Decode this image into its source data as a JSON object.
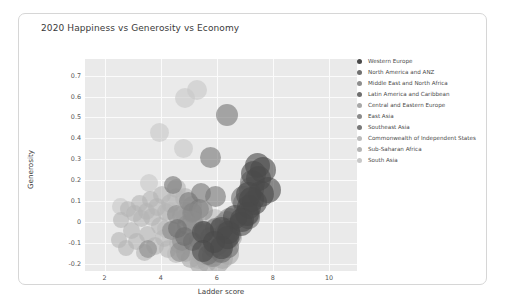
{
  "card": {
    "title": "2020 Happiness vs Generosity vs Economy"
  },
  "axes": {
    "x_title": "Ladder score",
    "y_title": "Generosity",
    "x_ticks": [
      "2",
      "4",
      "6",
      "8",
      "10"
    ],
    "y_ticks": [
      "0.7",
      "0.6",
      "0.5",
      "0.4",
      "0.3",
      "0.2",
      "0.1",
      "0",
      "-0.1",
      "-0.2"
    ]
  },
  "legend": {
    "items": [
      {
        "label": "Western Europe",
        "color": "#4a4a4a"
      },
      {
        "label": "North America and ANZ",
        "color": "#707070"
      },
      {
        "label": "Middle East and North Africa",
        "color": "#8d8d8d"
      },
      {
        "label": "Latin America and Caribbean",
        "color": "#6e6e6e"
      },
      {
        "label": "Central and Eastern Europe",
        "color": "#a8a8a8"
      },
      {
        "label": "East Asia",
        "color": "#8a8a8a"
      },
      {
        "label": "Southeast Asia",
        "color": "#787878"
      },
      {
        "label": "Commonwealth of Independent States",
        "color": "#bcbcbc"
      },
      {
        "label": "Sub-Saharan Africa",
        "color": "#b4b4b4"
      },
      {
        "label": "South Asia",
        "color": "#c8c8c8"
      }
    ]
  },
  "chart_data": {
    "type": "scatter",
    "title": "2020 Happiness vs Generosity vs Economy",
    "xlabel": "Ladder score",
    "ylabel": "Generosity",
    "xlim": [
      1.3,
      11.0
    ],
    "ylim": [
      -0.235,
      0.78
    ],
    "grid": true,
    "legend_position": "right",
    "size_encodes": "Economy (GDP per capita)",
    "color_encodes": "Regional indicator",
    "series": [
      {
        "name": "Western Europe",
        "color": "#4a4a4a",
        "points": [
          {
            "x": 7.81,
            "y": 0.153,
            "size": 26
          },
          {
            "x": 7.65,
            "y": 0.25,
            "size": 26
          },
          {
            "x": 7.56,
            "y": 0.135,
            "size": 26
          },
          {
            "x": 7.5,
            "y": 0.207,
            "size": 25
          },
          {
            "x": 7.45,
            "y": 0.271,
            "size": 25
          },
          {
            "x": 7.35,
            "y": 0.093,
            "size": 25
          },
          {
            "x": 7.3,
            "y": 0.23,
            "size": 25
          },
          {
            "x": 7.23,
            "y": 0.108,
            "size": 25
          },
          {
            "x": 7.16,
            "y": 0.07,
            "size": 24
          },
          {
            "x": 7.13,
            "y": 0.133,
            "size": 25
          },
          {
            "x": 7.08,
            "y": 0.04,
            "size": 24
          },
          {
            "x": 6.91,
            "y": 0.01,
            "size": 24
          },
          {
            "x": 6.86,
            "y": -0.011,
            "size": 24
          },
          {
            "x": 6.66,
            "y": 0.025,
            "size": 24
          },
          {
            "x": 6.4,
            "y": -0.05,
            "size": 23
          },
          {
            "x": 6.39,
            "y": -0.074,
            "size": 23
          },
          {
            "x": 6.18,
            "y": -0.122,
            "size": 23
          },
          {
            "x": 6.15,
            "y": -0.03,
            "size": 23
          },
          {
            "x": 5.91,
            "y": -0.095,
            "size": 22
          },
          {
            "x": 5.52,
            "y": -0.048,
            "size": 22
          },
          {
            "x": 5.51,
            "y": -0.141,
            "size": 22
          }
        ]
      },
      {
        "name": "North America and ANZ",
        "color": "#707070",
        "points": [
          {
            "x": 7.29,
            "y": 0.19,
            "size": 25
          },
          {
            "x": 7.23,
            "y": 0.157,
            "size": 25
          },
          {
            "x": 7.03,
            "y": 0.09,
            "size": 25
          },
          {
            "x": 6.94,
            "y": 0.11,
            "size": 25
          }
        ]
      },
      {
        "name": "Middle East and North Africa",
        "color": "#8d8d8d",
        "points": [
          {
            "x": 7.13,
            "y": 0.038,
            "size": 24
          },
          {
            "x": 6.38,
            "y": -0.006,
            "size": 24
          },
          {
            "x": 6.22,
            "y": -0.099,
            "size": 23
          },
          {
            "x": 6.01,
            "y": -0.142,
            "size": 22
          },
          {
            "x": 5.55,
            "y": -0.06,
            "size": 22
          },
          {
            "x": 5.49,
            "y": 0.057,
            "size": 21
          },
          {
            "x": 5.38,
            "y": -0.083,
            "size": 21
          },
          {
            "x": 5.12,
            "y": 0.002,
            "size": 21
          },
          {
            "x": 4.93,
            "y": -0.017,
            "size": 20
          },
          {
            "x": 4.75,
            "y": -0.091,
            "size": 20
          },
          {
            "x": 4.68,
            "y": -0.142,
            "size": 20
          },
          {
            "x": 4.55,
            "y": 0.035,
            "size": 19
          },
          {
            "x": 4.37,
            "y": -0.043,
            "size": 19
          },
          {
            "x": 3.53,
            "y": -0.131,
            "size": 18
          }
        ]
      },
      {
        "name": "Latin America and Caribbean",
        "color": "#6e6e6e",
        "points": [
          {
            "x": 7.12,
            "y": 0.02,
            "size": 23
          },
          {
            "x": 6.47,
            "y": -0.064,
            "size": 22
          },
          {
            "x": 6.44,
            "y": -0.032,
            "size": 22
          },
          {
            "x": 6.39,
            "y": -0.118,
            "size": 22
          },
          {
            "x": 6.33,
            "y": -0.083,
            "size": 22
          },
          {
            "x": 6.26,
            "y": -0.055,
            "size": 21
          },
          {
            "x": 6.16,
            "y": -0.145,
            "size": 21
          },
          {
            "x": 6.13,
            "y": -0.089,
            "size": 21
          },
          {
            "x": 6.02,
            "y": -0.108,
            "size": 21
          },
          {
            "x": 5.95,
            "y": -0.031,
            "size": 21
          },
          {
            "x": 5.89,
            "y": -0.126,
            "size": 20
          },
          {
            "x": 5.77,
            "y": -0.074,
            "size": 20
          },
          {
            "x": 5.69,
            "y": -0.16,
            "size": 20
          },
          {
            "x": 5.53,
            "y": -0.045,
            "size": 20
          },
          {
            "x": 5.12,
            "y": -0.096,
            "size": 19
          },
          {
            "x": 4.85,
            "y": -0.07,
            "size": 19
          },
          {
            "x": 4.61,
            "y": -0.03,
            "size": 19
          }
        ]
      },
      {
        "name": "Central and Eastern Europe",
        "color": "#a8a8a8",
        "points": [
          {
            "x": 6.51,
            "y": -0.07,
            "size": 22
          },
          {
            "x": 6.4,
            "y": -0.155,
            "size": 22
          },
          {
            "x": 6.22,
            "y": -0.121,
            "size": 21
          },
          {
            "x": 6.19,
            "y": -0.174,
            "size": 21
          },
          {
            "x": 6.1,
            "y": -0.108,
            "size": 21
          },
          {
            "x": 6.05,
            "y": -0.196,
            "size": 21
          },
          {
            "x": 5.95,
            "y": -0.143,
            "size": 21
          },
          {
            "x": 5.88,
            "y": -0.081,
            "size": 20
          },
          {
            "x": 5.79,
            "y": -0.168,
            "size": 20
          },
          {
            "x": 5.73,
            "y": -0.129,
            "size": 20
          },
          {
            "x": 5.66,
            "y": -0.191,
            "size": 20
          },
          {
            "x": 5.55,
            "y": -0.104,
            "size": 20
          },
          {
            "x": 5.48,
            "y": -0.16,
            "size": 20
          },
          {
            "x": 5.38,
            "y": -0.202,
            "size": 19
          },
          {
            "x": 5.26,
            "y": -0.118,
            "size": 19
          },
          {
            "x": 5.08,
            "y": -0.176,
            "size": 19
          },
          {
            "x": 4.88,
            "y": -0.145,
            "size": 19
          }
        ]
      },
      {
        "name": "East Asia",
        "color": "#8a8a8a",
        "points": [
          {
            "x": 6.45,
            "y": 0.01,
            "size": 23
          },
          {
            "x": 6.18,
            "y": -0.021,
            "size": 22
          },
          {
            "x": 5.87,
            "y": -0.165,
            "size": 22
          },
          {
            "x": 5.77,
            "y": -0.108,
            "size": 21
          },
          {
            "x": 5.12,
            "y": 0.043,
            "size": 20
          },
          {
            "x": 5.46,
            "y": -0.057,
            "size": 20
          }
        ]
      },
      {
        "name": "Southeast Asia",
        "color": "#787878",
        "points": [
          {
            "x": 6.38,
            "y": 0.51,
            "size": 22
          },
          {
            "x": 5.96,
            "y": 0.12,
            "size": 21
          },
          {
            "x": 5.77,
            "y": 0.31,
            "size": 21
          },
          {
            "x": 5.43,
            "y": 0.14,
            "size": 20
          },
          {
            "x": 5.35,
            "y": 0.062,
            "size": 20
          },
          {
            "x": 5.12,
            "y": 0.045,
            "size": 19
          },
          {
            "x": 4.98,
            "y": 0.098,
            "size": 19
          },
          {
            "x": 4.43,
            "y": 0.175,
            "size": 18
          }
        ]
      },
      {
        "name": "Commonwealth of Independent States",
        "color": "#bcbcbc",
        "points": [
          {
            "x": 6.26,
            "y": -0.049,
            "size": 21
          },
          {
            "x": 6.01,
            "y": -0.092,
            "size": 21
          },
          {
            "x": 5.95,
            "y": 0.012,
            "size": 20
          },
          {
            "x": 5.55,
            "y": -0.134,
            "size": 20
          },
          {
            "x": 5.48,
            "y": -0.061,
            "size": 20
          },
          {
            "x": 5.35,
            "y": -0.178,
            "size": 19
          },
          {
            "x": 5.22,
            "y": -0.027,
            "size": 19
          },
          {
            "x": 5.02,
            "y": -0.118,
            "size": 19
          },
          {
            "x": 4.89,
            "y": 0.02,
            "size": 19
          },
          {
            "x": 4.68,
            "y": -0.083,
            "size": 18
          },
          {
            "x": 4.55,
            "y": -0.152,
            "size": 18
          },
          {
            "x": 4.19,
            "y": -0.035,
            "size": 18
          }
        ]
      },
      {
        "name": "Sub-Saharan Africa",
        "color": "#b4b4b4",
        "points": [
          {
            "x": 5.22,
            "y": -0.03,
            "size": 20
          },
          {
            "x": 5.12,
            "y": 0.075,
            "size": 20
          },
          {
            "x": 4.96,
            "y": -0.068,
            "size": 20
          },
          {
            "x": 4.88,
            "y": 0.115,
            "size": 20
          },
          {
            "x": 4.75,
            "y": 0.03,
            "size": 19
          },
          {
            "x": 4.62,
            "y": -0.105,
            "size": 19
          },
          {
            "x": 4.55,
            "y": 0.16,
            "size": 19
          },
          {
            "x": 4.43,
            "y": -0.042,
            "size": 19
          },
          {
            "x": 4.35,
            "y": 0.088,
            "size": 19
          },
          {
            "x": 4.26,
            "y": -0.13,
            "size": 18
          },
          {
            "x": 4.18,
            "y": 0.046,
            "size": 18
          },
          {
            "x": 4.12,
            "y": -0.078,
            "size": 18
          },
          {
            "x": 4.05,
            "y": 0.13,
            "size": 18
          },
          {
            "x": 3.96,
            "y": -0.021,
            "size": 18
          },
          {
            "x": 3.88,
            "y": 0.07,
            "size": 18
          },
          {
            "x": 3.79,
            "y": -0.115,
            "size": 18
          },
          {
            "x": 3.7,
            "y": 0.025,
            "size": 18
          },
          {
            "x": 3.62,
            "y": 0.105,
            "size": 17
          },
          {
            "x": 3.53,
            "y": -0.06,
            "size": 17
          },
          {
            "x": 3.48,
            "y": 0.052,
            "size": 17
          },
          {
            "x": 3.41,
            "y": -0.148,
            "size": 17
          },
          {
            "x": 3.32,
            "y": 0.015,
            "size": 17
          },
          {
            "x": 3.24,
            "y": 0.09,
            "size": 17
          },
          {
            "x": 3.15,
            "y": -0.095,
            "size": 17
          },
          {
            "x": 3.08,
            "y": 0.038,
            "size": 17
          },
          {
            "x": 2.97,
            "y": -0.04,
            "size": 17
          },
          {
            "x": 2.85,
            "y": 0.062,
            "size": 16
          },
          {
            "x": 2.77,
            "y": -0.125,
            "size": 16
          },
          {
            "x": 2.57,
            "y": 0.01,
            "size": 16
          },
          {
            "x": 2.52,
            "y": -0.088,
            "size": 16
          }
        ]
      },
      {
        "name": "South Asia",
        "color": "#c8c8c8",
        "points": [
          {
            "x": 5.29,
            "y": 0.63,
            "size": 20
          },
          {
            "x": 4.88,
            "y": 0.595,
            "size": 20
          },
          {
            "x": 3.97,
            "y": 0.43,
            "size": 19
          },
          {
            "x": 4.81,
            "y": 0.35,
            "size": 19
          },
          {
            "x": 4.55,
            "y": 0.12,
            "size": 18
          },
          {
            "x": 4.28,
            "y": 0.053,
            "size": 18
          },
          {
            "x": 3.57,
            "y": 0.185,
            "size": 18
          },
          {
            "x": 2.57,
            "y": 0.075,
            "size": 17
          }
        ]
      }
    ]
  }
}
